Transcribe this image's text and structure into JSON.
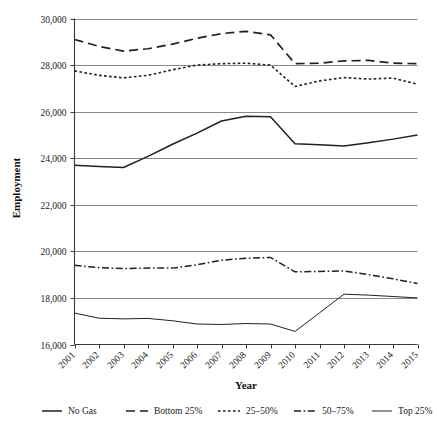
{
  "chart_data": {
    "type": "line",
    "title": "",
    "xlabel": "Year",
    "ylabel": "Employment",
    "x": [
      2001,
      2002,
      2003,
      2004,
      2005,
      2006,
      2007,
      2008,
      2009,
      2010,
      2011,
      2012,
      2013,
      2014,
      2015
    ],
    "categories": [
      "2001",
      "2002",
      "2003",
      "2004",
      "2005",
      "2006",
      "2007",
      "2008",
      "2009",
      "2010",
      "2011",
      "2012",
      "2013",
      "2014",
      "2015"
    ],
    "xlim": [
      2001,
      2015
    ],
    "ylim": [
      16000,
      30000
    ],
    "ytick_labels": [
      "16,000",
      "18,000",
      "20,000",
      "22,000",
      "24,000",
      "26,000",
      "28,000",
      "30,000"
    ],
    "ytick_values": [
      16000,
      18000,
      20000,
      22000,
      24000,
      26000,
      28000,
      30000
    ],
    "grid": "horizontal",
    "legend_position": "bottom",
    "series": [
      {
        "name": "No Gas",
        "style": "solid",
        "values": [
          23700,
          23640,
          23600,
          24080,
          24600,
          25080,
          25600,
          25800,
          25780,
          24620,
          24580,
          24520,
          24660,
          24820,
          25000
        ]
      },
      {
        "name": "Bottom 25%",
        "style": "long-dash",
        "values": [
          29100,
          28800,
          28600,
          28700,
          28900,
          29150,
          29350,
          29450,
          29300,
          28060,
          28080,
          28180,
          28200,
          28080,
          28060
        ]
      },
      {
        "name": "25-50%",
        "style": "dotted",
        "values": [
          27750,
          27560,
          27450,
          27560,
          27800,
          28000,
          28060,
          28080,
          28000,
          27080,
          27320,
          27460,
          27400,
          27440,
          27180
        ]
      },
      {
        "name": "50-75%",
        "style": "dash-dot",
        "values": [
          19400,
          19300,
          19260,
          19280,
          19280,
          19420,
          19620,
          19700,
          19740,
          19120,
          19140,
          19160,
          19000,
          18820,
          18620
        ]
      },
      {
        "name": "Top 25%",
        "style": "thin-solid",
        "values": [
          17350,
          17130,
          17100,
          17120,
          17020,
          16880,
          16860,
          16900,
          16880,
          16560,
          17360,
          18160,
          18120,
          18060,
          18000
        ]
      }
    ]
  },
  "legend": {
    "items": [
      {
        "label": "No Gas",
        "style": "solid"
      },
      {
        "label": "Bottom 25%",
        "style": "long-dash"
      },
      {
        "label": "25–50%",
        "style": "dotted"
      },
      {
        "label": "50–75%",
        "style": "dash-dot"
      },
      {
        "label": "Top 25%",
        "style": "thin-solid"
      }
    ]
  },
  "axes": {
    "x_title": "Year",
    "y_title": "Employment"
  }
}
